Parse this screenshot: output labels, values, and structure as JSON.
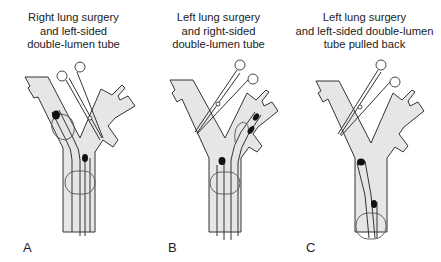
{
  "figure": {
    "panels": [
      {
        "letter": "A",
        "title_lines": [
          "Right lung surgery",
          "and left-sided",
          "double-lumen tube"
        ]
      },
      {
        "letter": "B",
        "title_lines": [
          "Left lung surgery",
          "and right-sided",
          "double-lumen tube"
        ]
      },
      {
        "letter": "C",
        "title_lines": [
          "Left lung surgery",
          "and left-sided double-lumen",
          "tube pulled back"
        ]
      }
    ],
    "colors": {
      "airway_fill": "#e6e6e6",
      "outline": "#333333",
      "cuff_dot": "#111111",
      "background": "#ffffff"
    },
    "icons": [
      "surgical-clamp-icon",
      "bronchial-tree-icon",
      "double-lumen-tube-icon"
    ]
  }
}
